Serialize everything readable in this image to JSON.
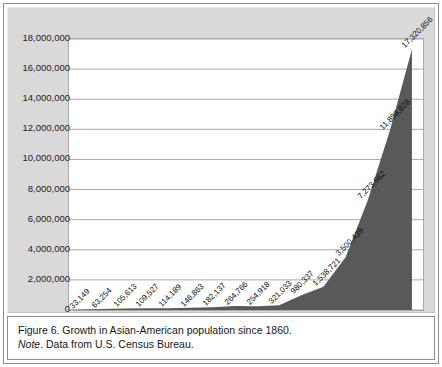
{
  "figure": {
    "caption_line1": "Figure 6. Growth in Asian-American population since 1860.",
    "note_label": "Note",
    "note_rest": ". Data from U.S. Census Bureau.",
    "panel_bg": "#d9d9d9",
    "plot_bg": "#ffffff",
    "area_color": "#595959",
    "gridline_color": "#a9a9a9"
  },
  "chart_data": {
    "type": "area",
    "title": "",
    "xlabel": "",
    "ylabel": "",
    "grid": true,
    "legend": "none",
    "xlim": [
      "1860",
      "2010"
    ],
    "ylim": [
      0,
      18000000
    ],
    "ytick_labels": [
      "18,000,000",
      "16,000,000",
      "14,000,000",
      "12,000,000",
      "10,000,000",
      "8,000,000",
      "6,000,000",
      "4,000,000",
      "2,000,000",
      "0"
    ],
    "ytick_values": [
      18000000,
      16000000,
      14000000,
      12000000,
      10000000,
      8000000,
      6000000,
      4000000,
      2000000,
      0
    ],
    "categories": [
      "1860",
      "1870",
      "1880",
      "1890",
      "1900",
      "1910",
      "1920",
      "1930",
      "1940",
      "1950",
      "1960",
      "1970",
      "1980",
      "1990",
      "2000",
      "2010"
    ],
    "values": [
      33149,
      63254,
      105613,
      109527,
      114189,
      146863,
      182137,
      264766,
      254918,
      321033,
      980337,
      1538721,
      3500439,
      7273662,
      11898828,
      17320856
    ],
    "point_labels": [
      "33,149",
      "63,254",
      "105,613",
      "109,527",
      "114,189",
      "146,863",
      "182,137",
      "264,766",
      "254,918",
      "321,033",
      "980,337",
      "1,538,721",
      "3,500,439",
      "7,273,662",
      "11,898,828",
      "17,320,856"
    ]
  }
}
